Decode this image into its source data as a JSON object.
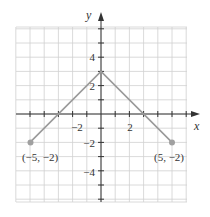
{
  "chart_data": {
    "type": "line",
    "title": "",
    "xlabel": "x",
    "ylabel": "y",
    "xlim": [
      -6,
      6
    ],
    "ylim": [
      -6.2,
      6.2
    ],
    "grid": true,
    "x_ticks": [
      -2,
      2
    ],
    "x_tick_labels": [
      "−2",
      "2"
    ],
    "y_ticks": [
      4,
      2,
      -2,
      -4
    ],
    "y_tick_labels": [
      "4",
      "2",
      "−2",
      "−4"
    ],
    "series": [
      {
        "name": "piecewise",
        "points": [
          [
            -5,
            -2
          ],
          [
            0,
            3
          ],
          [
            5,
            -2
          ]
        ],
        "color": "#9a9a9a"
      }
    ],
    "annotations": [
      {
        "text": "(−5, −2)",
        "x": -5,
        "y": -2
      },
      {
        "text": "(5, −2)",
        "x": 5,
        "y": -2
      }
    ],
    "endpoints": [
      [
        -5,
        -2
      ],
      [
        5,
        -2
      ]
    ]
  },
  "labels": {
    "x_axis": "x",
    "y_axis": "y",
    "x_tick_neg2": "−2",
    "x_tick_2": "2",
    "y_tick_4": "4",
    "y_tick_2": "2",
    "y_tick_neg2": "−2",
    "y_tick_neg4": "−4",
    "point_left": "(−5, −2)",
    "point_right": "(5, −2)"
  },
  "colors": {
    "grid": "#d0d0d0",
    "axis": "#333333",
    "line": "#9a9a9a",
    "point": "#a0a0a0"
  }
}
